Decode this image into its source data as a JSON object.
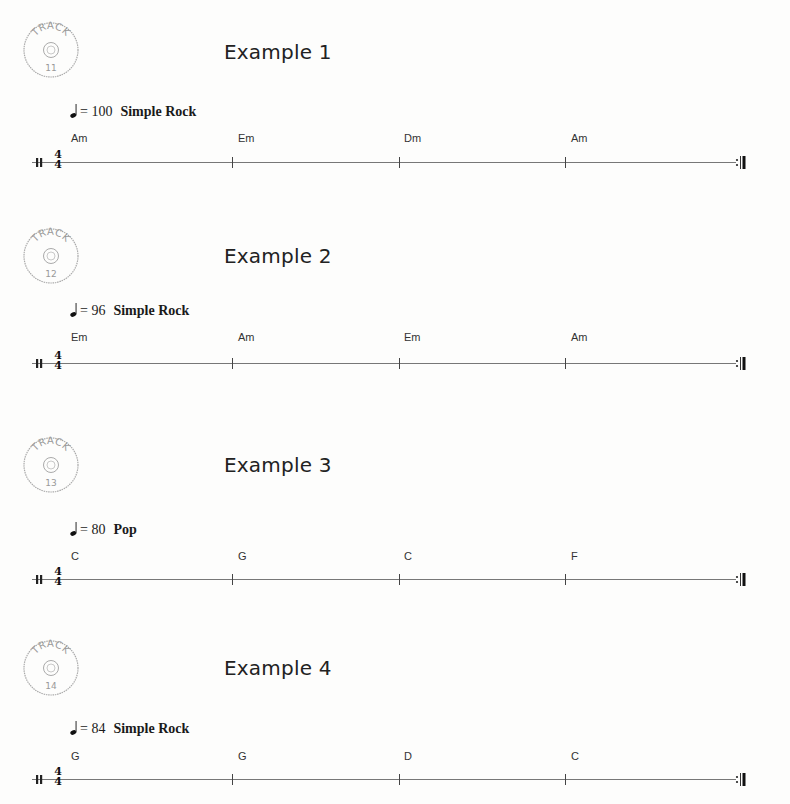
{
  "examples": [
    {
      "track_label": "TRACK",
      "track_number": "11",
      "title": "Example 1",
      "tempo": {
        "note_symbol": "quarter-note",
        "equals": "=",
        "bpm": "100",
        "style": "Simple Rock"
      },
      "time_signature": {
        "top": "4",
        "bottom": "4"
      },
      "chords": [
        "Am",
        "Em",
        "Dm",
        "Am"
      ]
    },
    {
      "track_label": "TRACK",
      "track_number": "12",
      "title": "Example 2",
      "tempo": {
        "note_symbol": "quarter-note",
        "equals": "=",
        "bpm": "96",
        "style": "Simple Rock"
      },
      "time_signature": {
        "top": "4",
        "bottom": "4"
      },
      "chords": [
        "Em",
        "Am",
        "Em",
        "Am"
      ]
    },
    {
      "track_label": "TRACK",
      "track_number": "13",
      "title": "Example 3",
      "tempo": {
        "note_symbol": "quarter-note",
        "equals": "=",
        "bpm": "80",
        "style": "Pop"
      },
      "time_signature": {
        "top": "4",
        "bottom": "4"
      },
      "chords": [
        "C",
        "G",
        "C",
        "F"
      ]
    },
    {
      "track_label": "TRACK",
      "track_number": "14",
      "title": "Example 4",
      "tempo": {
        "note_symbol": "quarter-note",
        "equals": "=",
        "bpm": "84",
        "style": "Simple Rock"
      },
      "time_signature": {
        "top": "4",
        "bottom": "4"
      },
      "chords": [
        "G",
        "G",
        "D",
        "C"
      ]
    }
  ]
}
